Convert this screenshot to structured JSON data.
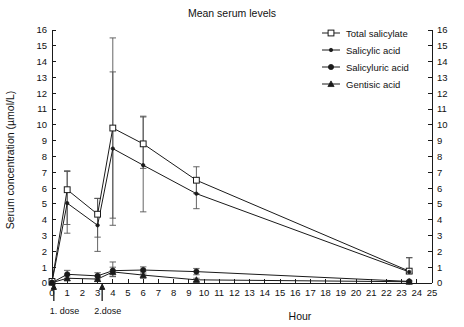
{
  "chart_data": {
    "type": "line",
    "title": "Mean serum levels",
    "xlabel": "Hour",
    "ylabel": "Serum concentration (µmol/L)",
    "xlim": [
      0,
      25
    ],
    "ylim": [
      0,
      16
    ],
    "grid": false,
    "legend_position": "top-right",
    "xticks": [
      "0",
      "1",
      "2",
      "3",
      "4",
      "5",
      "6",
      "7",
      "8",
      "9",
      "10",
      "11",
      "12",
      "13",
      "14",
      "15",
      "16",
      "17",
      "18",
      "19",
      "20",
      "21",
      "22",
      "23",
      "24",
      "25"
    ],
    "yticks": [
      "0",
      "1",
      "2",
      "3",
      "4",
      "5",
      "6",
      "7",
      "8",
      "9",
      "10",
      "11",
      "12",
      "13",
      "14",
      "15",
      "16"
    ],
    "right_axis": true,
    "right_yticks": [
      "0",
      "1",
      "2",
      "3",
      "4",
      "5",
      "6",
      "7",
      "8",
      "9",
      "10",
      "11",
      "12",
      "13",
      "14",
      "15",
      "16"
    ],
    "x": [
      0,
      1,
      3,
      4,
      6,
      9.5,
      23.5
    ],
    "series": [
      {
        "name": "Total salicylate",
        "marker": "open-square",
        "values": [
          0.1,
          5.9,
          4.35,
          9.8,
          8.8,
          6.5,
          0.75
        ],
        "err_low": [
          0.1,
          2.2,
          1.45,
          5.7,
          1.55,
          0.85,
          0.1
        ],
        "err_high": [
          0.1,
          1.2,
          1.0,
          5.7,
          1.75,
          0.85,
          0.85
        ]
      },
      {
        "name": "Salicylic acid",
        "marker": "small-dot",
        "values": [
          0.05,
          5.05,
          3.65,
          8.5,
          7.45,
          5.65,
          0.7
        ],
        "err_low": [
          0.05,
          1.9,
          1.65,
          4.85,
          2.95,
          0.95,
          0.1
        ],
        "err_high": [
          0.05,
          2.0,
          1.7,
          4.85,
          3.05,
          0.95,
          0.9
        ]
      },
      {
        "name": "Salicyluric acid",
        "marker": "filled-circle",
        "values": [
          0.02,
          0.55,
          0.45,
          0.78,
          0.82,
          0.72,
          0.1
        ],
        "err_low": [
          0.02,
          0.25,
          0.2,
          0.35,
          0.25,
          0.2,
          0.05
        ],
        "err_high": [
          0.02,
          0.25,
          0.2,
          0.55,
          0.2,
          0.2,
          0.05
        ]
      },
      {
        "name": "Gentisic acid",
        "marker": "triangle",
        "values": [
          0.02,
          0.3,
          0.25,
          0.7,
          0.5,
          0.2,
          0.08
        ],
        "err_low": [
          0.02,
          0.15,
          0.15,
          0.3,
          0.2,
          0.1,
          0.04
        ],
        "err_high": [
          0.02,
          0.15,
          0.15,
          0.3,
          0.2,
          0.1,
          0.04
        ]
      }
    ],
    "annotations": [
      {
        "label": "1. dose",
        "x": 0.12,
        "marker": "up-arrow"
      },
      {
        "label": "2.dose",
        "x": 3.3,
        "marker": "up-arrow"
      }
    ]
  },
  "legend": {
    "items": [
      {
        "label": "Total salicylate",
        "marker": "open-square"
      },
      {
        "label": "Salicylic acid",
        "marker": "small-dot"
      },
      {
        "label": "Salicyluric acid",
        "marker": "filled-circle"
      },
      {
        "label": "Gentisic acid",
        "marker": "triangle"
      }
    ]
  },
  "colors": {
    "ink": "#1a1a1a",
    "error_bar": "#555555",
    "background": "#ffffff"
  }
}
